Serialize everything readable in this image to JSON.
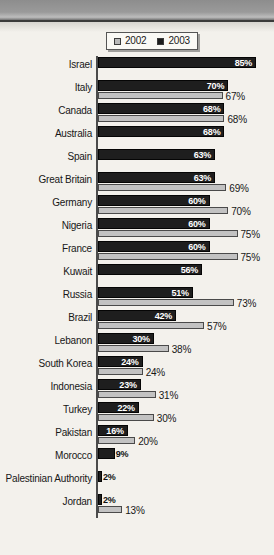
{
  "chart_data": {
    "type": "bar",
    "orientation": "horizontal",
    "title": "",
    "xlabel": "",
    "ylabel": "",
    "xlim": [
      0,
      100
    ],
    "grid": false,
    "legend_position": "top",
    "legend": [
      "2002",
      "2003"
    ],
    "value_suffix": "%",
    "colors": {
      "series_2002": "#c2c2c2",
      "series_2003": "#1e1e1e",
      "background": "#f3f1ec",
      "text": "#171717",
      "axis": "#4b4b4b"
    },
    "categories": [
      "Israel",
      "Italy",
      "Canada",
      "Australia",
      "Spain",
      "Great Britain",
      "Germany",
      "Nigeria",
      "France",
      "Kuwait",
      "Russia",
      "Brazil",
      "Lebanon",
      "South Korea",
      "Indonesia",
      "Turkey",
      "Pakistan",
      "Morocco",
      "Palestinian Authority",
      "Jordan"
    ],
    "series": [
      {
        "name": "2003",
        "values": [
          85,
          70,
          68,
          68,
          63,
          63,
          60,
          60,
          60,
          56,
          51,
          42,
          30,
          24,
          23,
          22,
          16,
          9,
          2,
          2
        ],
        "labels": [
          "85%",
          "70%",
          "68%",
          "68%",
          "63%",
          "63%",
          "60%",
          "60%",
          "60%",
          "56%",
          "51%",
          "42%",
          "30%",
          "24%",
          "23%",
          "22%",
          "16%",
          "9%",
          "2%",
          "2%"
        ]
      },
      {
        "name": "2002",
        "values": [
          null,
          67,
          68,
          null,
          null,
          69,
          70,
          75,
          75,
          null,
          73,
          57,
          38,
          24,
          31,
          30,
          20,
          null,
          null,
          13
        ],
        "labels": [
          "",
          "67%",
          "68%",
          "",
          "",
          "69%",
          "70%",
          "75%",
          "75%",
          "",
          "73%",
          "57%",
          "38%",
          "24%",
          "31%",
          "30%",
          "20%",
          "",
          "",
          "13%"
        ]
      }
    ]
  }
}
